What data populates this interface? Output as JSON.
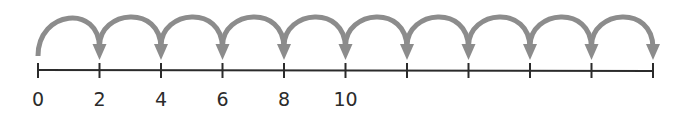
{
  "number_line": {
    "start": 0,
    "step": 2,
    "tick_count": 11,
    "hop_count": 10,
    "labels": [
      "0",
      "2",
      "4",
      "6",
      "8",
      "10",
      "",
      "",
      "",
      "",
      ""
    ],
    "colors": {
      "axis": "#2b2b2b",
      "hop_arrow": "#8c8c8c",
      "label": "#2b2b2b"
    }
  }
}
